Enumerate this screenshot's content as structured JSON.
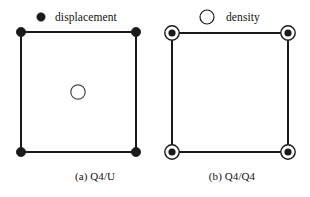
{
  "figure": {
    "background_color": "#ffffff",
    "ink_color": "#1a1a1a",
    "legend": {
      "displacement": {
        "label": "displacement",
        "marker": "filled-dot",
        "marker_color": "#1a1a1a"
      },
      "density": {
        "label": "density",
        "marker": "open-circle",
        "marker_color": "#1a1a1a"
      }
    },
    "panels": [
      {
        "id": "panel-a",
        "caption": "(a) Q4/U",
        "element_type": "Q4/U",
        "corner_nodes": [
          {
            "name": "top-left",
            "x": 21,
            "y": 32,
            "marker": "filled-dot"
          },
          {
            "name": "top-right",
            "x": 136,
            "y": 32,
            "marker": "filled-dot"
          },
          {
            "name": "bottom-right",
            "x": 136,
            "y": 152,
            "marker": "filled-dot"
          },
          {
            "name": "bottom-left",
            "x": 21,
            "y": 152,
            "marker": "filled-dot"
          }
        ],
        "interior_nodes": [
          {
            "name": "center",
            "x": 78,
            "y": 92,
            "marker": "open-circle"
          }
        ]
      },
      {
        "id": "panel-b",
        "caption": "(b) Q4/Q4",
        "element_type": "Q4/Q4",
        "corner_nodes": [
          {
            "name": "top-left",
            "x": 172,
            "y": 33,
            "marker": "dot-in-circle"
          },
          {
            "name": "top-right",
            "x": 288,
            "y": 33,
            "marker": "dot-in-circle"
          },
          {
            "name": "bottom-right",
            "x": 288,
            "y": 152,
            "marker": "dot-in-circle"
          },
          {
            "name": "bottom-left",
            "x": 172,
            "y": 152,
            "marker": "dot-in-circle"
          }
        ],
        "interior_nodes": []
      }
    ]
  }
}
